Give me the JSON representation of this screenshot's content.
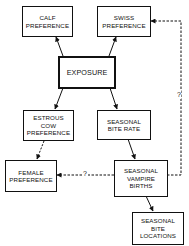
{
  "diagram": {
    "nodes": [
      {
        "id": "calf",
        "label": "CALF\nPREFERENCE"
      },
      {
        "id": "swiss",
        "label": "SWISS\nPREFERENCE"
      },
      {
        "id": "exposure",
        "label": "EXPOSURE"
      },
      {
        "id": "estrous",
        "label": "ESTROUS\nCOW\nPREFERENCE"
      },
      {
        "id": "bite_rate",
        "label": "SEASONAL\nBITE RATE"
      },
      {
        "id": "female",
        "label": "FEMALE\nPREFERENCE"
      },
      {
        "id": "births",
        "label": "SEASONAL\nVAMPIRE\nBIRTHS"
      },
      {
        "id": "locations",
        "label": "SEASONAL\nBITE\nLOCATIONS"
      }
    ],
    "edges": [
      {
        "from": "exposure",
        "to": "calf",
        "style": "solid"
      },
      {
        "from": "exposure",
        "to": "swiss",
        "style": "solid"
      },
      {
        "from": "exposure",
        "to": "estrous",
        "style": "solid"
      },
      {
        "from": "exposure",
        "to": "bite_rate",
        "style": "solid"
      },
      {
        "from": "estrous",
        "to": "female",
        "style": "dashed"
      },
      {
        "from": "bite_rate",
        "to": "births",
        "style": "solid"
      },
      {
        "from": "births",
        "to": "locations",
        "style": "solid"
      },
      {
        "from": "births",
        "to": "female",
        "style": "dashed",
        "label": "?"
      },
      {
        "from": "births",
        "to": "swiss",
        "style": "dashed",
        "label": "?"
      }
    ],
    "uncertain_mark": "?"
  }
}
